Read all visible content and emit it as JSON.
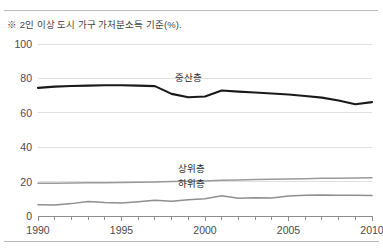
{
  "figure": {
    "top_clipped_text": "",
    "note": "※ 2인 이상 도시 가구 가처분소득 기준(%)."
  },
  "chart_data": {
    "type": "line",
    "title": "",
    "subtitle": "",
    "xlabel": "",
    "ylabel": "",
    "note": "※ 2인 이상 도시 가구 가처분소득 기준(%).",
    "xlim": [
      1990,
      2010
    ],
    "ylim": [
      0,
      100
    ],
    "yticks": [
      0,
      20,
      40,
      60,
      80,
      100
    ],
    "xticks": [
      1990,
      1995,
      2000,
      2005,
      2010
    ],
    "xtick_labels": [
      "1990",
      "1995",
      "2000",
      "2005",
      "2010"
    ],
    "ytick_labels": [
      "0",
      "20",
      "40",
      "60",
      "80",
      "100"
    ],
    "grid": "horizontal",
    "minor_xticks_every": 1,
    "legend": "inline-labels",
    "x": [
      1990,
      1991,
      1992,
      1993,
      1994,
      1995,
      1996,
      1997,
      1998,
      1999,
      2000,
      2001,
      2002,
      2003,
      2004,
      2005,
      2006,
      2007,
      2008,
      2009,
      2010
    ],
    "series": [
      {
        "name": "중산층",
        "label": "중산층",
        "color": "#1a1a1a",
        "width": 2.1,
        "label_x": 1999.0,
        "label_y": 81.5,
        "values": [
          74.5,
          75.2,
          75.6,
          75.8,
          76.0,
          76.0,
          75.8,
          75.5,
          71.0,
          69.0,
          69.5,
          73.0,
          72.3,
          71.8,
          71.2,
          70.6,
          69.8,
          68.8,
          67.2,
          65.0,
          66.2
        ]
      },
      {
        "name": "상위층",
        "label": "상위층",
        "color": "#9a9a9a",
        "width": 1.5,
        "label_x": 1999.2,
        "label_y": 28.5,
        "values": [
          19.0,
          19.1,
          19.2,
          19.3,
          19.4,
          19.5,
          19.6,
          19.8,
          20.0,
          20.2,
          20.4,
          20.8,
          21.0,
          21.2,
          21.4,
          21.5,
          21.7,
          21.9,
          22.0,
          22.1,
          22.2
        ]
      },
      {
        "name": "하위층",
        "label": "하위층",
        "color": "#8f8f8f",
        "width": 1.5,
        "label_x": 1999.2,
        "label_y": 19.5,
        "values": [
          6.5,
          6.4,
          7.2,
          8.4,
          7.8,
          7.5,
          8.3,
          9.2,
          8.6,
          9.4,
          10.0,
          11.8,
          10.3,
          10.6,
          10.4,
          11.6,
          12.0,
          12.2,
          12.1,
          12.0,
          11.9
        ]
      }
    ],
    "colors": {
      "middle_class": "#1a1a1a",
      "upper_class": "#9a9a9a",
      "lower_class": "#8f8f8f",
      "grid": "#e0e0e0",
      "axis": "#8d8d8d",
      "text": "#4a4a4a"
    }
  }
}
